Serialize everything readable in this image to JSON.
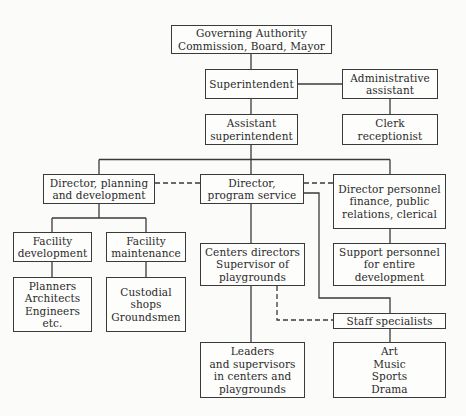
{
  "chart": {
    "type": "org-chart",
    "nodes": {
      "governing": {
        "lines": [
          "Governing Authority",
          "Commission, Board, Mayor"
        ]
      },
      "superintendent": {
        "lines": [
          "Superintendent"
        ]
      },
      "admin_assistant": {
        "lines": [
          "Administrative",
          "assistant"
        ]
      },
      "assistant_super": {
        "lines": [
          "Assistant",
          "superintendent"
        ]
      },
      "clerk": {
        "lines": [
          "Clerk",
          "receptionist"
        ]
      },
      "dir_planning": {
        "lines": [
          "Director, planning",
          "and development"
        ]
      },
      "dir_program": {
        "lines": [
          "Director,",
          "program service"
        ]
      },
      "dir_personnel": {
        "lines": [
          "Director personnel",
          "finance, public",
          "relations, clerical"
        ]
      },
      "facility_dev": {
        "lines": [
          "Facility",
          "development"
        ]
      },
      "facility_maint": {
        "lines": [
          "Facility",
          "maintenance"
        ]
      },
      "centers": {
        "lines": [
          "Centers directors",
          "Supervisor of",
          "playgrounds"
        ]
      },
      "support": {
        "lines": [
          "Support personnel",
          "for entire",
          "development"
        ]
      },
      "planners": {
        "lines": [
          "Planners",
          "Architects",
          "Engineers",
          "etc."
        ]
      },
      "custodial": {
        "lines": [
          "Custodial",
          "shops",
          "Groundsmen"
        ]
      },
      "staff": {
        "lines": [
          "Staff specialists"
        ]
      },
      "leaders": {
        "lines": [
          "Leaders",
          "and supervisors",
          "in centers and",
          "playgrounds"
        ]
      },
      "arts": {
        "lines": [
          "Art",
          "Music",
          "Sports",
          "Drama"
        ]
      }
    },
    "edges": [
      {
        "from": "governing",
        "to": "superintendent",
        "style": "solid"
      },
      {
        "from": "superintendent",
        "to": "admin_assistant",
        "style": "solid"
      },
      {
        "from": "admin_assistant",
        "to": "clerk",
        "style": "solid"
      },
      {
        "from": "superintendent",
        "to": "assistant_super",
        "style": "solid"
      },
      {
        "from": "assistant_super",
        "to": "dir_planning",
        "style": "solid"
      },
      {
        "from": "assistant_super",
        "to": "dir_program",
        "style": "solid"
      },
      {
        "from": "assistant_super",
        "to": "dir_personnel",
        "style": "solid"
      },
      {
        "from": "dir_planning",
        "to": "dir_program",
        "style": "dashed"
      },
      {
        "from": "dir_program",
        "to": "dir_personnel",
        "style": "dashed"
      },
      {
        "from": "dir_planning",
        "to": "facility_dev",
        "style": "solid"
      },
      {
        "from": "dir_planning",
        "to": "facility_maint",
        "style": "solid"
      },
      {
        "from": "facility_dev",
        "to": "planners",
        "style": "solid"
      },
      {
        "from": "facility_maint",
        "to": "custodial",
        "style": "solid"
      },
      {
        "from": "dir_program",
        "to": "centers",
        "style": "solid"
      },
      {
        "from": "dir_program",
        "to": "staff",
        "style": "solid"
      },
      {
        "from": "centers",
        "to": "leaders",
        "style": "solid"
      },
      {
        "from": "centers",
        "to": "staff",
        "style": "dashed"
      },
      {
        "from": "dir_personnel",
        "to": "support",
        "style": "solid"
      },
      {
        "from": "staff",
        "to": "arts",
        "style": "solid"
      }
    ]
  }
}
